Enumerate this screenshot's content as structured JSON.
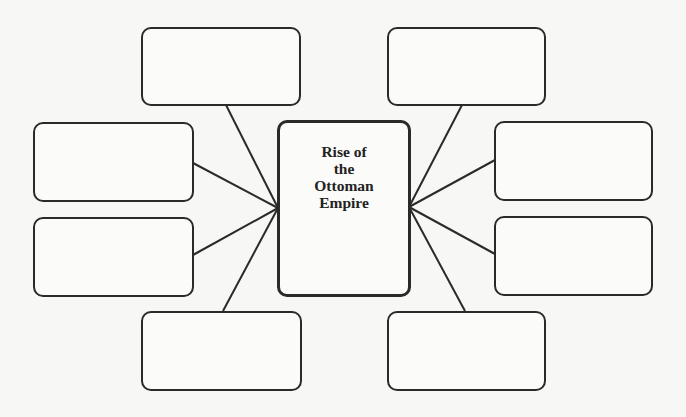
{
  "diagram": {
    "type": "graphic-organizer",
    "center": {
      "title": "Rise of\nthe\nOttoman\nEmpire"
    },
    "boxes": [
      {
        "id": "top-left",
        "text": ""
      },
      {
        "id": "top-right",
        "text": ""
      },
      {
        "id": "left-upper",
        "text": ""
      },
      {
        "id": "left-lower",
        "text": ""
      },
      {
        "id": "right-upper",
        "text": ""
      },
      {
        "id": "right-lower",
        "text": ""
      },
      {
        "id": "bottom-left",
        "text": ""
      },
      {
        "id": "bottom-right",
        "text": ""
      }
    ],
    "line_color": "#2a2a2a"
  }
}
